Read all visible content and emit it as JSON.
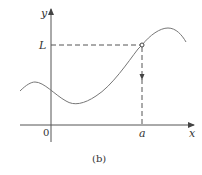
{
  "figure": {
    "caption": "(b)",
    "axes": {
      "x_label": "x",
      "y_label": "y",
      "origin_label": "0",
      "x_marker_label": "a",
      "y_marker_label": "L"
    },
    "colors": {
      "axis": "#555555",
      "curve": "#777777",
      "dashed": "#555555",
      "text": "#333333"
    },
    "annotations": {
      "point": "open circle at (a, L)",
      "horizontal_guide": "dashed line from L on y-axis to point (a, L)",
      "vertical_guide": "dashed line from point (a, L) down to a on x-axis, with downward arrow"
    }
  }
}
